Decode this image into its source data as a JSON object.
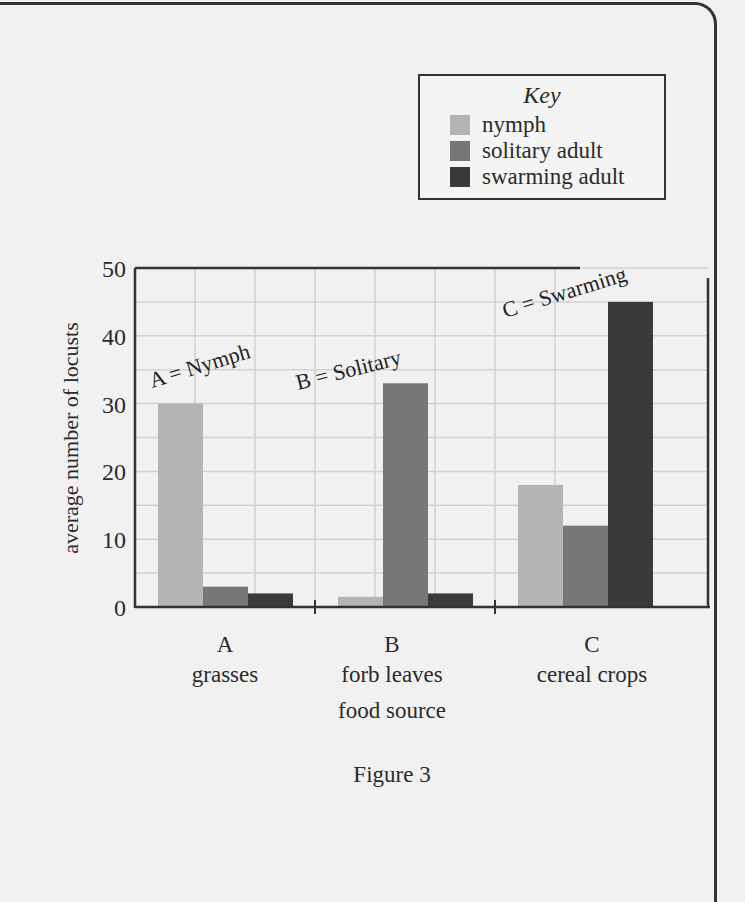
{
  "figure_caption": "Figure 3",
  "key": {
    "title": "Key",
    "items": [
      {
        "label": "nymph",
        "color": "#b4b4b4"
      },
      {
        "label": "solitary adult",
        "color": "#777777"
      },
      {
        "label": "swarming adult",
        "color": "#3a3a3a"
      }
    ]
  },
  "axis": {
    "ylabel": "average number of locusts",
    "xlabel": "food source",
    "yticks": [
      "0",
      "10",
      "20",
      "30",
      "40",
      "50"
    ]
  },
  "categories": [
    {
      "letter": "A",
      "name": "grasses"
    },
    {
      "letter": "B",
      "name": "forb leaves"
    },
    {
      "letter": "C",
      "name": "cereal crops"
    }
  ],
  "annotations": [
    "A = Nymph",
    "B = Solitary",
    "C = Swarming"
  ],
  "chart_data": {
    "type": "bar",
    "title": "Figure 3",
    "xlabel": "food source",
    "ylabel": "average number of locusts",
    "categories": [
      "A grasses",
      "B forb leaves",
      "C cereal crops"
    ],
    "series": [
      {
        "name": "nymph",
        "color": "#b4b4b4",
        "values": [
          30,
          1.5,
          18
        ]
      },
      {
        "name": "solitary adult",
        "color": "#777777",
        "values": [
          3,
          33,
          12
        ]
      },
      {
        "name": "swarming adult",
        "color": "#3a3a3a",
        "values": [
          2,
          2,
          45
        ]
      }
    ],
    "ylim": [
      0,
      50
    ],
    "yticks": [
      0,
      10,
      20,
      30,
      40,
      50
    ],
    "grid": true,
    "legend_position": "top-right (outside plot)",
    "annotations": [
      "A = Nymph",
      "B = Solitary",
      "C = Swarming"
    ]
  }
}
